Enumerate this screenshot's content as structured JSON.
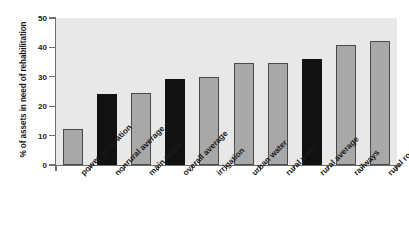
{
  "chart_data": {
    "type": "bar",
    "title": "",
    "subtitle": "",
    "xlabel": "",
    "ylabel": "% of assets in need of rehabilitation",
    "ylim": [
      0,
      50
    ],
    "yticks": [
      0,
      10,
      20,
      30,
      40,
      50
    ],
    "grid": false,
    "legend": "none",
    "plot_background": "#e8e8e8",
    "categories": [
      "power generation",
      "nonrural average",
      "main roads",
      "overall average",
      "irrigation",
      "urban water",
      "rural water",
      "rural average",
      "railways",
      "rural roads"
    ],
    "values": [
      12.4,
      24.3,
      24.6,
      29.4,
      29.8,
      34.6,
      34.8,
      36.0,
      40.8,
      42.2
    ],
    "bar_colors": [
      "#a8a8a8",
      "#111111",
      "#a8a8a8",
      "#111111",
      "#a8a8a8",
      "#a8a8a8",
      "#a8a8a8",
      "#111111",
      "#a8a8a8",
      "#a8a8a8"
    ],
    "bar_styles": [
      "gray",
      "black",
      "gray",
      "black",
      "gray",
      "gray",
      "gray",
      "black",
      "gray",
      "gray"
    ]
  }
}
